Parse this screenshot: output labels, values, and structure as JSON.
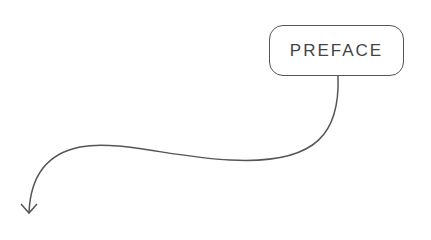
{
  "diagram": {
    "label": "PREFACE",
    "connector": "curved-arrow",
    "stroke_color": "#555555"
  }
}
